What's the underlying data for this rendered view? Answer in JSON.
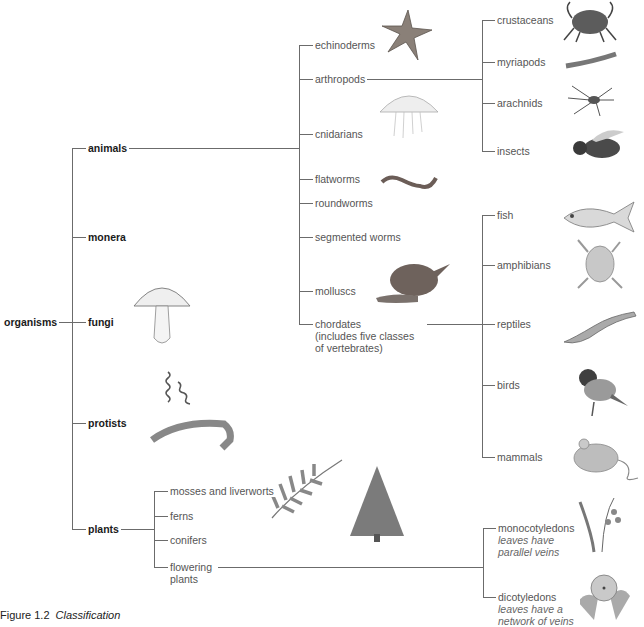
{
  "root": {
    "label": "organisms"
  },
  "kingdoms": [
    {
      "label": "animals"
    },
    {
      "label": "monera"
    },
    {
      "label": "fungi"
    },
    {
      "label": "protists"
    },
    {
      "label": "plants"
    }
  ],
  "animal_phyla": [
    {
      "label": "echinoderms"
    },
    {
      "label": "arthropods"
    },
    {
      "label": "cnidarians"
    },
    {
      "label": "flatworms"
    },
    {
      "label": "roundworms"
    },
    {
      "label": "segmented worms"
    },
    {
      "label": "molluscs"
    },
    {
      "label": "chordates",
      "note_line1": "(includes five classes",
      "note_line2": "of vertebrates)"
    }
  ],
  "arthropod_classes": [
    {
      "label": "crustaceans"
    },
    {
      "label": "myriapods"
    },
    {
      "label": "arachnids"
    },
    {
      "label": "insects"
    }
  ],
  "vertebrate_classes": [
    {
      "label": "fish"
    },
    {
      "label": "amphibians"
    },
    {
      "label": "reptiles"
    },
    {
      "label": "birds"
    },
    {
      "label": "mammals"
    }
  ],
  "plant_groups": [
    {
      "label": "mosses and liverworts"
    },
    {
      "label": "ferns"
    },
    {
      "label": "conifers"
    },
    {
      "label": "flowering",
      "label_line2": "plants"
    }
  ],
  "flowering_classes": [
    {
      "label": "monocotyledons",
      "desc_line1": "leaves have",
      "desc_line2": "parallel veins"
    },
    {
      "label": "dicotyledons",
      "desc_line1": "leaves have a",
      "desc_line2": "network of veins"
    }
  ],
  "illustrations": [
    "starfish",
    "jellyfish",
    "worm",
    "snail",
    "crab",
    "millipede",
    "spider",
    "bee",
    "fish",
    "frog",
    "lizard",
    "bird",
    "mouse",
    "mushroom",
    "spirilla-bacteria",
    "protist",
    "fern-frond",
    "conifer-tree",
    "bluebell",
    "primrose"
  ],
  "caption": {
    "figure": "Figure 1.2",
    "title": "Classification"
  },
  "colors": {
    "line": "#6b6b6b",
    "label": "#555555",
    "bold_label": "#1a1a1a",
    "background": "#ffffff"
  }
}
